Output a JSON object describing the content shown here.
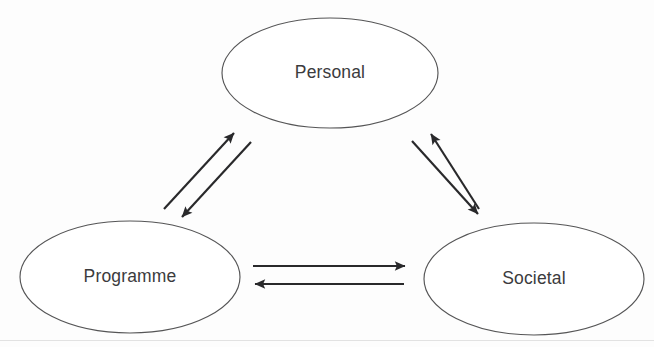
{
  "diagram": {
    "type": "cycle-diagram",
    "background_color": "#fdfdfd",
    "node_stroke_color": "#555556",
    "node_fill_color": "#ffffff",
    "arrow_color": "#29292b",
    "label_color": "#3b3b3d",
    "nodes": [
      {
        "id": "personal",
        "label": "Personal",
        "cx": 330,
        "cy": 73,
        "rx": 108,
        "ry": 55
      },
      {
        "id": "programme",
        "label": "Programme",
        "cx": 130,
        "cy": 277,
        "rx": 110,
        "ry": 56
      },
      {
        "id": "societal",
        "label": "Societal",
        "cx": 534,
        "cy": 279,
        "rx": 110,
        "ry": 56
      }
    ],
    "edges": [
      {
        "id": "programme-to-personal",
        "from": "programme",
        "to": "personal",
        "direction": "up-right",
        "x1": 164,
        "y1": 209,
        "x2": 234,
        "y2": 133
      },
      {
        "id": "personal-to-programme",
        "from": "personal",
        "to": "programme",
        "direction": "down-left",
        "x1": 251,
        "y1": 142,
        "x2": 182,
        "y2": 217
      },
      {
        "id": "societal-to-personal",
        "from": "societal",
        "to": "personal",
        "direction": "up-left",
        "x1": 479,
        "y1": 209,
        "x2": 431,
        "y2": 134
      },
      {
        "id": "personal-to-societal",
        "from": "personal",
        "to": "societal",
        "direction": "down-right",
        "x1": 412,
        "y1": 141,
        "x2": 478,
        "y2": 214
      },
      {
        "id": "programme-to-societal",
        "from": "programme",
        "to": "societal",
        "direction": "right",
        "x1": 253,
        "y1": 266,
        "x2": 405,
        "y2": 266
      },
      {
        "id": "societal-to-programme",
        "from": "societal",
        "to": "programme",
        "direction": "left",
        "x1": 404,
        "y1": 284,
        "x2": 255,
        "y2": 284
      }
    ]
  }
}
